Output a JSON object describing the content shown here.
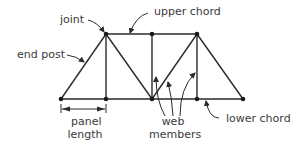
{
  "labels": {
    "joint": "joint",
    "upper_chord": "upper chord",
    "end_post": "end post",
    "panel_length_line1": "panel",
    "panel_length_line2": "length",
    "web_members_line1": "web",
    "web_members_line2": "members",
    "lower_chord": "lower chord"
  },
  "colors": {
    "stroke": "#2a2a2a",
    "text": "#3a3a3a",
    "background": "#ffffff"
  },
  "truss": {
    "lower_nodes": [
      [
        61,
        99
      ],
      [
        106,
        99
      ],
      [
        152,
        99
      ],
      [
        197,
        99
      ],
      [
        243,
        99
      ]
    ],
    "upper_nodes": [
      [
        106,
        34
      ],
      [
        152,
        34
      ],
      [
        197,
        34
      ]
    ],
    "members": [
      [
        [
          61,
          99
        ],
        [
          243,
          99
        ]
      ],
      [
        [
          106,
          34
        ],
        [
          197,
          34
        ]
      ],
      [
        [
          61,
          99
        ],
        [
          106,
          34
        ]
      ],
      [
        [
          243,
          99
        ],
        [
          197,
          34
        ]
      ],
      [
        [
          106,
          34
        ],
        [
          106,
          99
        ]
      ],
      [
        [
          152,
          34
        ],
        [
          152,
          99
        ]
      ],
      [
        [
          197,
          34
        ],
        [
          197,
          99
        ]
      ],
      [
        [
          106,
          34
        ],
        [
          152,
          99
        ]
      ],
      [
        [
          152,
          99
        ],
        [
          197,
          34
        ]
      ]
    ]
  }
}
